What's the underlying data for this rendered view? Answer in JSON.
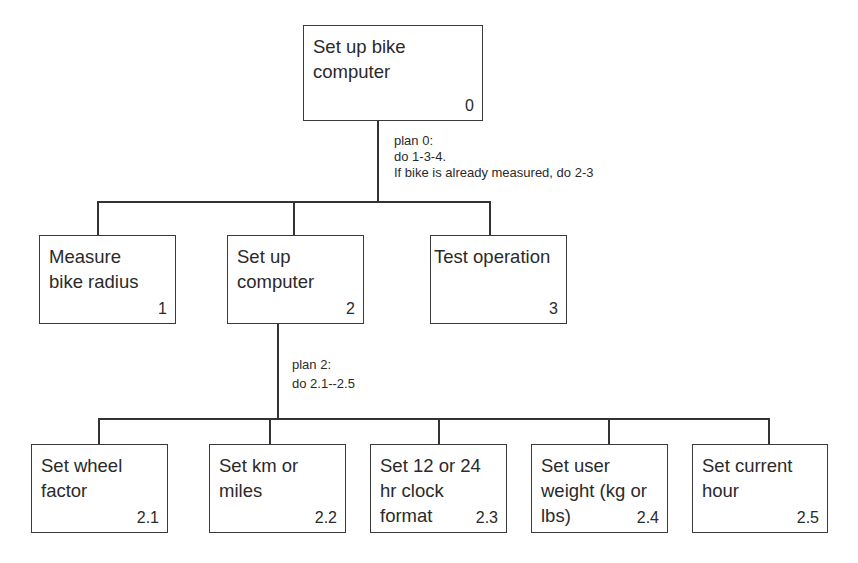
{
  "diagram": {
    "type": "hierarchical task analysis",
    "root": {
      "label": "Set up bike\ncomputer",
      "number": "0",
      "plan": "plan 0:\ndo 1-3-4.\nIf bike is already measured, do 2-3"
    },
    "level1": [
      {
        "label": "Measure\nbike radius",
        "number": "1"
      },
      {
        "label": "Set up\ncomputer",
        "number": "2",
        "plan": "plan 2:\ndo 2.1--2.5"
      },
      {
        "label": "Test operation",
        "number": "3"
      }
    ],
    "level2": [
      {
        "label": "Set wheel\nfactor",
        "number": "2.1"
      },
      {
        "label": "Set km or\nmiles",
        "number": "2.2"
      },
      {
        "label": "Set 12 or 24\nhr clock\nformat",
        "number": "2.3"
      },
      {
        "label": "Set user\nweight (kg or\nlbs)",
        "number": "2.4"
      },
      {
        "label": "Set current\nhour",
        "number": "2.5"
      }
    ]
  }
}
